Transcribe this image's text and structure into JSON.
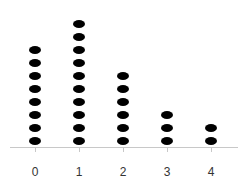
{
  "chart_data": {
    "type": "dot",
    "title": "",
    "xlabel": "",
    "ylabel": "",
    "categories": [
      "0",
      "1",
      "2",
      "3",
      "4"
    ],
    "values": [
      8,
      10,
      6,
      3,
      2
    ],
    "grid": false,
    "legend": null,
    "colors": {
      "dot": "#000000",
      "axis": "#c8c8c8",
      "label": "#333333"
    }
  }
}
